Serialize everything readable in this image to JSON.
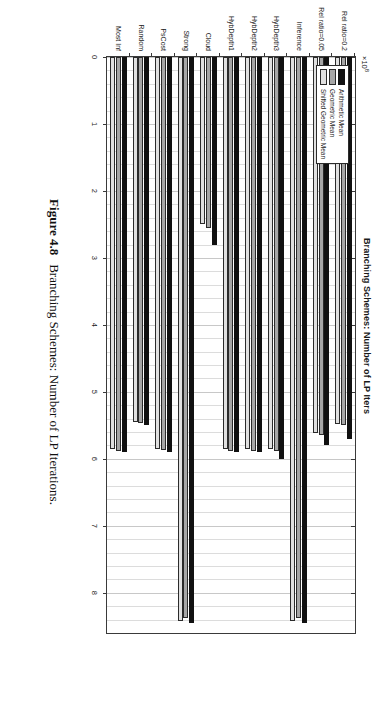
{
  "figure": {
    "caption_number": "Figure 4.8",
    "caption_text": "Branching Schemes: Number of LP Iterations."
  },
  "chart_data": {
    "type": "bar",
    "orientation": "horizontal",
    "title": "Branching Schemes: Number of LP Iters",
    "xlabel": "",
    "ylabel": "",
    "exponent_label": "×10",
    "exponent_value": "8",
    "xlim": [
      0,
      8.6
    ],
    "xticks": [
      0,
      1,
      2,
      3,
      4,
      5,
      6,
      7,
      8
    ],
    "xticklabels": [
      "0",
      "1",
      "2",
      "3",
      "4",
      "5",
      "6",
      "7",
      "8"
    ],
    "grid": true,
    "legend_position": "top-left",
    "categories": [
      "Most Inf",
      "Random",
      "PsCost",
      "Strong",
      "Cloud",
      "HybDepth1",
      "HybDepth2",
      "HybDepth3",
      "Inference",
      "Rel ratio=0.05",
      "Rel ratio=0.2"
    ],
    "series": [
      {
        "name": "Arithmetic Mean",
        "color": "#111111",
        "values": [
          5.9,
          5.5,
          5.9,
          8.45,
          2.8,
          5.9,
          5.9,
          6.0,
          8.45,
          5.8,
          5.7
        ]
      },
      {
        "name": "Geometric Mean",
        "color": "#a6a6a6",
        "values": [
          5.88,
          5.47,
          5.87,
          8.38,
          2.55,
          5.88,
          5.88,
          5.88,
          8.38,
          5.65,
          5.5
        ]
      },
      {
        "name": "Shifted Geometric Mean",
        "color": "#e0e0e0",
        "values": [
          5.86,
          5.45,
          5.85,
          8.42,
          2.5,
          5.86,
          5.86,
          5.86,
          8.42,
          5.62,
          5.48
        ]
      }
    ]
  }
}
